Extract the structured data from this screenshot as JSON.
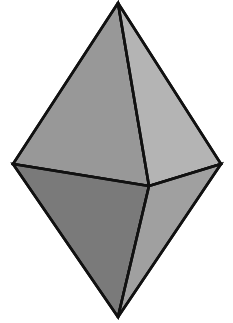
{
  "figure": {
    "name": "bipyramid-solid",
    "title": "Hexagonal-outline bipyramid (octahedron-like solid)",
    "background_color": "#ffffff",
    "edge_color": "#111111",
    "edge_width": 2.6,
    "canvas": {
      "width": 233,
      "height": 323
    },
    "vertices": {
      "apex_top": {
        "label": "top apex",
        "x": 118,
        "y": 3
      },
      "left": {
        "label": "left vertex",
        "x": 13,
        "y": 164
      },
      "right": {
        "label": "right vertex",
        "x": 221,
        "y": 164
      },
      "front_center": {
        "label": "front vertex",
        "x": 149,
        "y": 186
      },
      "apex_bottom": {
        "label": "bottom apex",
        "x": 118,
        "y": 317
      }
    },
    "faces": [
      {
        "name": "upper-left-face",
        "label": "Upper left face",
        "fill": "#989898",
        "points": "118,3 13,164 149,186"
      },
      {
        "name": "upper-right-face",
        "label": "Upper right face",
        "fill": "#b4b4b4",
        "points": "118,3 221,164 149,186"
      },
      {
        "name": "lower-left-face",
        "label": "Lower left face",
        "fill": "#7a7a7a",
        "points": "13,164 149,186 118,317"
      },
      {
        "name": "lower-right-face",
        "label": "Lower right face",
        "fill": "#a0a0a0",
        "points": "221,164 149,186 118,317"
      }
    ],
    "edges": [
      {
        "name": "edge-apex-to-left",
        "label": "top apex to left vertex",
        "path": "M118,3 L13,164"
      },
      {
        "name": "edge-apex-to-right",
        "label": "top apex to right vertex",
        "path": "M118,3 L221,164"
      },
      {
        "name": "edge-apex-to-front",
        "label": "top apex to front vertex",
        "path": "M118,3 L149,186"
      },
      {
        "name": "edge-left-to-front",
        "label": "left vertex to front vertex",
        "path": "M13,164 L149,186"
      },
      {
        "name": "edge-right-to-front",
        "label": "right vertex to front vertex",
        "path": "M221,164 L149,186"
      },
      {
        "name": "edge-left-to-bottom",
        "label": "left vertex to bottom apex",
        "path": "M13,164 L118,317"
      },
      {
        "name": "edge-right-to-bottom",
        "label": "right vertex to bottom apex",
        "path": "M221,164 L118,317"
      },
      {
        "name": "edge-front-to-bottom",
        "label": "front vertex to bottom apex",
        "path": "M149,186 L118,317"
      }
    ]
  }
}
